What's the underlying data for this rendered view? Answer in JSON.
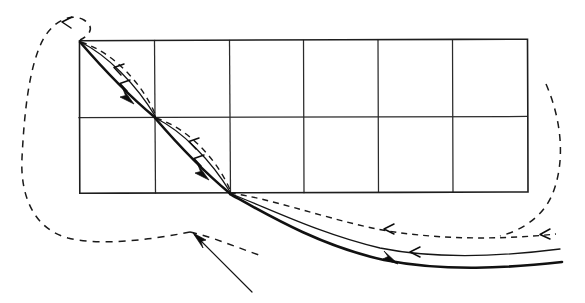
{
  "figure": {
    "title": "Hand-drawn ray diagram over rectangular grid",
    "background_color": "#ffffff",
    "ink_color": "#111111",
    "width": 585,
    "height": 303
  },
  "grid": {
    "name": "rectangular-grid",
    "columns": 6,
    "rows": 2,
    "left": 79,
    "right": 527,
    "top": 40,
    "bottom": 193,
    "mid_y": 117,
    "vertical_x": [
      79,
      154,
      229,
      303,
      378,
      452,
      527
    ],
    "horizontal_y": [
      40,
      117,
      193
    ],
    "cell_width": 74.7,
    "cell_height": 76.5,
    "line_color": "#2b2b2b",
    "frame_color": "#1e1e1e"
  },
  "nodes": {
    "top_left_corner": {
      "name": "upper-vertex",
      "x": 79,
      "y": 40
    },
    "center_vertex": {
      "name": "center-vertex",
      "x": 155,
      "y": 117
    },
    "bottom_vertex": {
      "name": "lower-vertex",
      "x": 230,
      "y": 193
    }
  },
  "curves": {
    "segment_one": {
      "name": "upper-diagonal-bundle",
      "from": "top_left_corner",
      "to": "center_vertex",
      "members": [
        {
          "style": "bold-solid",
          "direction": "down-right",
          "label": "outgoing-bold-path"
        },
        {
          "style": "thin-solid",
          "direction": "up-left",
          "label": "returning-thin-path"
        },
        {
          "style": "dashed",
          "direction": "up-left",
          "label": "returning-dashed-path"
        }
      ]
    },
    "segment_two": {
      "name": "lower-diagonal-bundle",
      "from": "center_vertex",
      "to": "bottom_vertex",
      "members": [
        {
          "style": "bold-solid",
          "direction": "down-right",
          "label": "outgoing-bold-path"
        },
        {
          "style": "thin-solid",
          "direction": "up-left",
          "label": "returning-thin-path"
        },
        {
          "style": "dashed",
          "direction": "up-left",
          "label": "returning-dashed-path"
        }
      ]
    },
    "fan_right": {
      "name": "lower-right-fan",
      "origin": "bottom_vertex",
      "members": [
        {
          "style": "dashed",
          "direction": "left-arrow",
          "label": "upper-dashed-return"
        },
        {
          "style": "thin-solid",
          "direction": "left-arrow",
          "label": "middle-solid-return"
        },
        {
          "style": "bold-solid",
          "direction": "right-arrow",
          "label": "lower-bold-outgoing"
        }
      ]
    },
    "loop_left": {
      "name": "left-dashed-return-loop",
      "style": "dashed",
      "direction": "counter-clockwise-to-upper-vertex",
      "arrow_at": {
        "x": 63,
        "y": 22
      }
    },
    "loop_right": {
      "name": "right-dashed-return-arc",
      "style": "dashed",
      "direction": "downward-then-left",
      "start": {
        "x": 546,
        "y": 84
      }
    },
    "straight_ray": {
      "name": "incident-straight-ray",
      "style": "thin-solid",
      "from": {
        "x": 252,
        "y": 292
      },
      "to": {
        "x": 194,
        "y": 234
      },
      "arrow_at_tip": true
    }
  },
  "arrows": [
    {
      "name": "arrow-upper-left-loop",
      "x": 63,
      "y": 22,
      "points": "left",
      "style": "open"
    },
    {
      "name": "arrow-seg1-dashed",
      "x": 116,
      "y": 68,
      "points": "up-left",
      "style": "open"
    },
    {
      "name": "arrow-seg1-thin",
      "x": 122,
      "y": 84,
      "points": "up-left",
      "style": "open"
    },
    {
      "name": "arrow-seg1-bold",
      "x": 128,
      "y": 99,
      "points": "down-right",
      "style": "solid"
    },
    {
      "name": "arrow-seg2-dashed",
      "x": 191,
      "y": 142,
      "points": "up-left",
      "style": "open"
    },
    {
      "name": "arrow-seg2-thin",
      "x": 196,
      "y": 159,
      "points": "up-left",
      "style": "open"
    },
    {
      "name": "arrow-seg2-bold",
      "x": 203,
      "y": 175,
      "points": "down-right",
      "style": "solid"
    },
    {
      "name": "arrow-fan-dashed",
      "x": 385,
      "y": 229,
      "points": "left",
      "style": "open"
    },
    {
      "name": "arrow-fan-thin",
      "x": 411,
      "y": 252,
      "points": "left",
      "style": "open"
    },
    {
      "name": "arrow-fan-bold",
      "x": 389,
      "y": 262,
      "points": "right",
      "style": "solid"
    },
    {
      "name": "arrow-right-arc",
      "x": 542,
      "y": 235,
      "points": "left",
      "style": "open"
    },
    {
      "name": "arrow-straight-ray-tip",
      "x": 194,
      "y": 234,
      "points": "up-left",
      "style": "solid"
    }
  ]
}
